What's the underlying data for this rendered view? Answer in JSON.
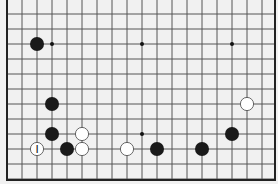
{
  "board": {
    "background": "#f1f1f1",
    "line_color": "#555555",
    "edge_color": "#222222",
    "origin_x": 7,
    "origin_y": 14,
    "spacing": 15,
    "columns": 19,
    "rows": 12,
    "edges": {
      "left": true,
      "right": true,
      "bottom": true,
      "top": false
    },
    "star_points": [
      [
        3,
        2
      ],
      [
        9,
        2
      ],
      [
        15,
        2
      ],
      [
        9,
        8
      ]
    ],
    "stones": [
      {
        "col": 2,
        "row": 2,
        "color": "black"
      },
      {
        "col": 3,
        "row": 6,
        "color": "black"
      },
      {
        "col": 3,
        "row": 8,
        "color": "black"
      },
      {
        "col": 5,
        "row": 8,
        "color": "white"
      },
      {
        "col": 2,
        "row": 9,
        "color": "white",
        "label": "I"
      },
      {
        "col": 4,
        "row": 9,
        "color": "black"
      },
      {
        "col": 5,
        "row": 9,
        "color": "white"
      },
      {
        "col": 8,
        "row": 9,
        "color": "white"
      },
      {
        "col": 10,
        "row": 9,
        "color": "black"
      },
      {
        "col": 13,
        "row": 9,
        "color": "black"
      },
      {
        "col": 15,
        "row": 8,
        "color": "black"
      },
      {
        "col": 16,
        "row": 6,
        "color": "white"
      }
    ]
  }
}
